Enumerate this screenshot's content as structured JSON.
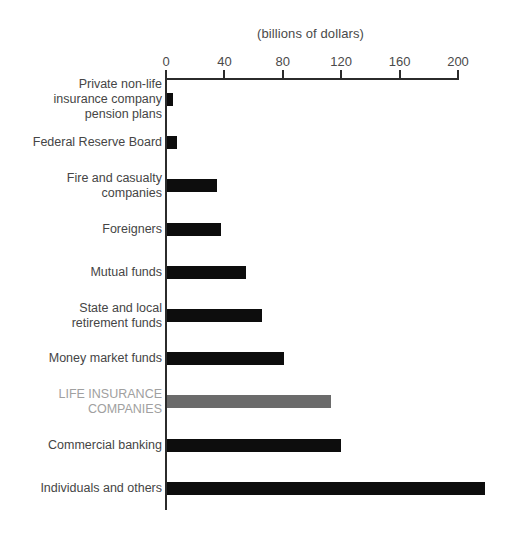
{
  "chart_data": {
    "type": "bar",
    "orientation": "horizontal",
    "title": "(billions of dollars)",
    "xlabel": "",
    "ylabel": "",
    "xlim": [
      0,
      200
    ],
    "xticks": [
      0,
      40,
      80,
      120,
      160,
      200
    ],
    "xtick_labels": [
      "0",
      "40",
      "80",
      "120",
      "160",
      "200"
    ],
    "grid": false,
    "legend": false,
    "categories": [
      "Private non-life\ninsurance company\npension plans",
      "Federal Reserve Board",
      "Fire and casualty\ncompanies",
      "Foreigners",
      "Mutual funds",
      "State and local\nretirement funds",
      "Money market funds",
      "LIFE INSURANCE\nCOMPANIES",
      "Commercial banking",
      "Individuals and others"
    ],
    "values": [
      4,
      7,
      34,
      37,
      54,
      65,
      80,
      112,
      119,
      218
    ],
    "highlight_index": 7,
    "bar_color": "#0d0d0d",
    "highlight_bar_color": "#6b6b6b",
    "highlight_label_color": "#a0a0a0"
  }
}
